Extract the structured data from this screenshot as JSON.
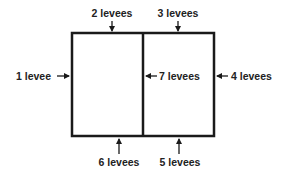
{
  "diagram": {
    "labels": {
      "top_left": "2 levees",
      "top_right": "3 levees",
      "left": "1 levee",
      "middle": "7 levees",
      "right": "4 levees",
      "bottom_left": "6 levees",
      "bottom_right": "5 levees"
    },
    "colors": {
      "line": "#1a1a1a",
      "text": "#222222"
    }
  }
}
